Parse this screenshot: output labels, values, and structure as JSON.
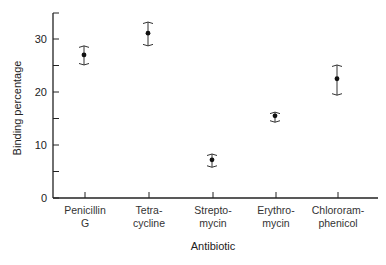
{
  "chart_data": {
    "type": "scatter",
    "title": "",
    "xlabel": "Antibiotic",
    "ylabel": "Binding percentage",
    "ylim": [
      0,
      35
    ],
    "yticks": [
      0,
      10,
      20,
      30
    ],
    "grid": false,
    "legend": null,
    "categories": [
      {
        "line1": "Penicillin",
        "line2": "G"
      },
      {
        "line1": "Tetra-",
        "line2": "cycline"
      },
      {
        "line1": "Strepto-",
        "line2": "mycin"
      },
      {
        "line1": "Erythro-",
        "line2": "mycin"
      },
      {
        "line1": "Chlororam-",
        "line2": "phenicol"
      }
    ],
    "series": [
      {
        "name": "Binding percentage",
        "values": [
          27.0,
          31.1,
          7.2,
          15.5,
          22.5
        ],
        "error_upper": [
          28.7,
          33.2,
          8.3,
          16.2,
          25.1
        ],
        "error_lower": [
          25.1,
          28.7,
          5.8,
          14.3,
          19.4
        ]
      }
    ]
  }
}
